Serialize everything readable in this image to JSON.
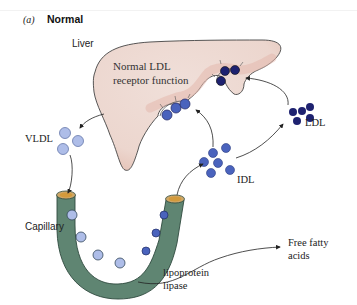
{
  "figure": {
    "panel_letter": "(a)",
    "panel_title": "Normal"
  },
  "labels": {
    "liver": "Liver",
    "liver_note": "Normal LDL receptor function",
    "vldl": "VLDL",
    "idl": "IDL",
    "ldl": "LDL",
    "capillary": "Capillary",
    "lipoprotein_lipase": "lipoprotein lipase",
    "free_fatty_acids": "Free fatty acids"
  },
  "colors": {
    "liver_fill": "#eed9d2",
    "liver_edge_tint": "#e3b8ad",
    "capillary_fill": "#5f8572",
    "capillary_lumen": "#d39a3c",
    "vldl_particle": "#aebde8",
    "idl_particle": "#4a63bd",
    "ldl_particle": "#1e2270",
    "outline": "#333333"
  }
}
